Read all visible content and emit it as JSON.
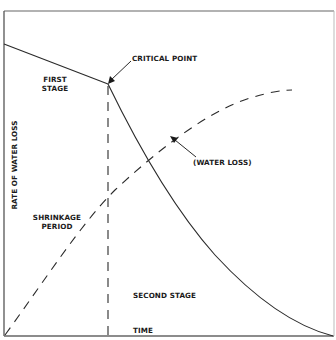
{
  "diagram": {
    "type": "drying-curve",
    "frame": {
      "left": 4,
      "top": 11,
      "right": 334,
      "bottom": 336
    },
    "colors": {
      "line": "#2a2a2a",
      "frame": "#555555",
      "frame_right": "#bbbbbb",
      "background": "#ffffff"
    },
    "axis_labels": {
      "y": "RATE OF WATER LOSS",
      "x": "TIME"
    },
    "labels": {
      "critical_point": "CRITICAL POINT",
      "first_stage_line1": "FIRST",
      "first_stage_line2": "STAGE",
      "shrinkage_line1": "SHRINKAGE",
      "shrinkage_line2": "PERIOD",
      "water_loss": "(WATER LOSS)",
      "second_stage": "SECOND STAGE"
    },
    "curves": {
      "rate_of_water_loss": {
        "style": "solid",
        "segments": [
          {
            "name": "first-stage",
            "from": [
              4,
              44
            ],
            "to": [
              108,
              84
            ]
          },
          {
            "name": "second-stage",
            "from": [
              108,
              84
            ],
            "via": [
              [
                145,
                158
              ],
              [
                208,
                248
              ],
              [
                250,
                290
              ],
              [
                300,
                330
              ]
            ],
            "to": [
              333,
              336
            ]
          }
        ]
      },
      "cumulative_water_loss": {
        "style": "dashed",
        "from": [
          4,
          336
        ],
        "via": [
          [
            108,
            195
          ],
          [
            170,
            137
          ],
          [
            240,
            100
          ]
        ],
        "to": [
          292,
          90
        ]
      },
      "critical_point_divider": {
        "style": "dashed",
        "x": 108,
        "from_y": 84,
        "to_y": 336
      }
    },
    "critical_point": {
      "x": 108,
      "y": 84
    }
  }
}
